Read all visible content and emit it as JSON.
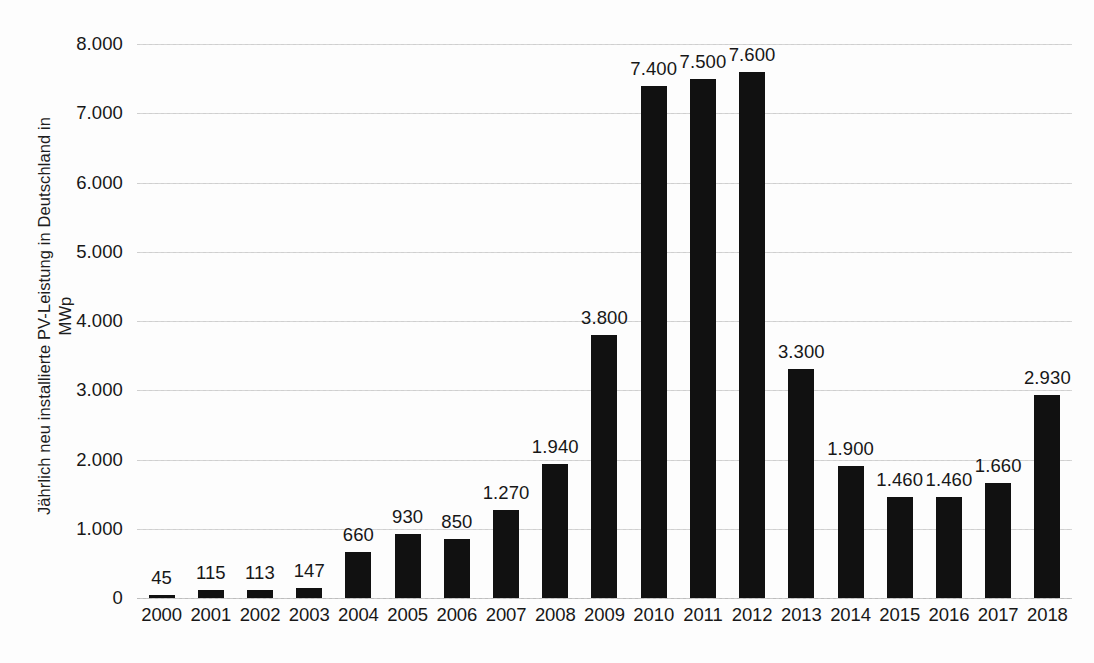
{
  "chart_data": {
    "type": "bar",
    "title": "",
    "subtitle": "",
    "xlabel": "",
    "ylabel": "Jährlich neu installierte PV-Leistung in Deutschland in MWp",
    "ylabel_lines": [
      "Jährlich neu installierte PV-Leistung in Deutschland in",
      "MWp"
    ],
    "categories": [
      "2000",
      "2001",
      "2002",
      "2003",
      "2004",
      "2005",
      "2006",
      "2007",
      "2008",
      "2009",
      "2010",
      "2011",
      "2012",
      "2013",
      "2014",
      "2015",
      "2016",
      "2017",
      "2018"
    ],
    "values": [
      45,
      115,
      113,
      147,
      660,
      930,
      850,
      1270,
      1940,
      3800,
      7400,
      7500,
      7600,
      3300,
      1900,
      1460,
      1460,
      1660,
      2930
    ],
    "value_labels": [
      "45",
      "115",
      "113",
      "147",
      "660",
      "930",
      "850",
      "1.270",
      "1.940",
      "3.800",
      "7.400",
      "7.500",
      "7.600",
      "3.300",
      "1.900",
      "1.460",
      "1.460",
      "1.660",
      "2.930"
    ],
    "bar_plot_values": [
      45,
      115,
      113,
      147,
      660,
      930,
      850,
      1270,
      1940,
      3800,
      7400,
      7500,
      7600,
      3300,
      1900,
      1460,
      1460,
      1660,
      2930
    ],
    "ylim": [
      0,
      8000
    ],
    "ytick_values": [
      0,
      1000,
      2000,
      3000,
      4000,
      5000,
      6000,
      7000,
      8000
    ],
    "ytick_labels": [
      "0",
      "1.000",
      "2.000",
      "3.000",
      "4.000",
      "5.000",
      "6.000",
      "7.000",
      "8.000"
    ],
    "grid": true,
    "grid_axis": "y",
    "grid_style": "dotted",
    "legend": false,
    "legend_position": "none",
    "bar_color": "#111111",
    "grid_color": "#d0d0d0",
    "text_color": "#171717",
    "background_color": "#fdfdfd",
    "data_labels": true,
    "data_label_position": "above-bar"
  }
}
